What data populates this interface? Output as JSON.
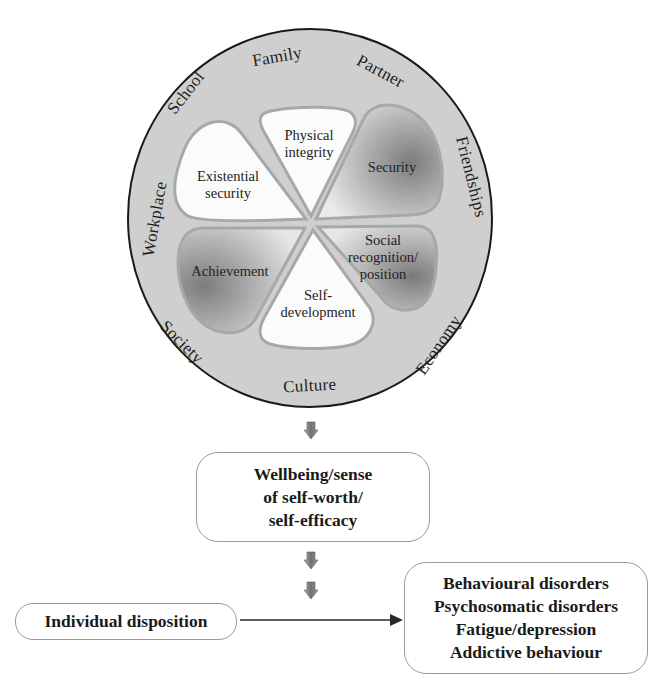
{
  "outer_ring": {
    "labels": {
      "family": "Family",
      "partner": "Partner",
      "friendships": "Friendships",
      "economy": "Economy",
      "culture": "Culture",
      "society": "Society",
      "workplace": "Workplace",
      "school": "School"
    },
    "fill_color": "#cfcfcf",
    "stroke_color": "#1a1a1a"
  },
  "petals": {
    "physical_integrity": [
      "Physical",
      "integrity"
    ],
    "security": [
      "Security"
    ],
    "social_recognition": [
      "Social",
      "recognition/",
      "position"
    ],
    "self_development": [
      "Self-",
      "development"
    ],
    "achievement": [
      "Achievement"
    ],
    "existential_security": [
      "Existential",
      "security"
    ]
  },
  "wellbeing": {
    "lines": [
      "Wellbeing/sense",
      "of self-worth/",
      "self-efficacy"
    ]
  },
  "individual_disposition": {
    "label": "Individual disposition"
  },
  "outcomes": {
    "lines": [
      "Behavioural disorders",
      "Psychosomatic disorders",
      "Fatigue/depression",
      "Addictive behaviour"
    ]
  },
  "colors": {
    "arrow_fill": "#8a8a8a",
    "box_border": "#9a9a9a"
  }
}
